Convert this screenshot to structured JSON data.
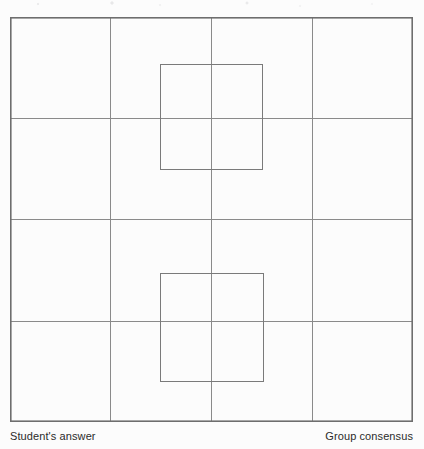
{
  "figure": {
    "title": "",
    "type": "grid-diagram",
    "canvas": {
      "width": 424,
      "height": 449
    },
    "background_color": "#fcfcfc",
    "grid": {
      "columns": 4,
      "rows": 4,
      "left": 10,
      "top": 17,
      "right": 413,
      "bottom": 422,
      "vertical_line_x": [
        10,
        110,
        211,
        312,
        413
      ],
      "horizontal_line_y": [
        17,
        118,
        219,
        321,
        422
      ],
      "outer_border_color": "#6e6e6e",
      "outer_border_width": 1.6,
      "inner_line_color": "#8a8a8a",
      "inner_line_width": 1
    },
    "marked_squares": [
      {
        "name": "students-answer-square",
        "x": 160,
        "y": 64,
        "width": 102,
        "height": 105,
        "stroke_color": "#7a7a7a",
        "stroke_width": 1,
        "fill": "none"
      },
      {
        "name": "group-consensus-square",
        "x": 160,
        "y": 273,
        "width": 103,
        "height": 108,
        "stroke_color": "#7a7a7a",
        "stroke_width": 1,
        "fill": "none"
      }
    ]
  },
  "captions": {
    "left": "Student's answer",
    "right": "Group consensus",
    "color": "#2b2b2b",
    "font_size_px": 11
  }
}
